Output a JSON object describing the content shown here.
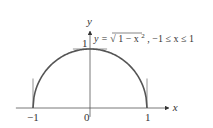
{
  "chart_data": {
    "type": "line",
    "title": "",
    "xlabel": "x",
    "ylabel": "y",
    "xlim": [
      -1.3,
      1.45
    ],
    "ylim": [
      -0.15,
      1.35
    ],
    "grid": false,
    "x_ticks": [
      {
        "value": -1,
        "label": "−1"
      },
      {
        "value": 0,
        "label": "0"
      },
      {
        "value": 1,
        "label": "1"
      }
    ],
    "y_ticks": [
      {
        "value": 1,
        "label": "1"
      }
    ],
    "series": [
      {
        "name": "y = √(1 − x²)",
        "function": "sqrt(1 - x^2)",
        "domain": [
          -1,
          1
        ],
        "color": "#555555"
      }
    ],
    "tangent_lines": [
      {
        "name": "vertical tangent at x=-1",
        "type": "vertical",
        "x": -1,
        "y_range": [
          0,
          0.5
        ]
      },
      {
        "name": "horizontal tangent at x=0",
        "type": "horizontal",
        "y": 1,
        "x_range": [
          -0.3,
          0.3
        ]
      },
      {
        "name": "vertical tangent at x=1",
        "type": "vertical",
        "x": 1,
        "y_range": [
          0,
          0.5
        ]
      }
    ],
    "annotations": [
      {
        "text_parts": {
          "lhs": "y = ",
          "radicand": "1 − x",
          "exp": "2",
          "rest": ", −1 ≤ x ≤ 1"
        },
        "anchor": "near (0, 1), right of y-axis"
      }
    ]
  }
}
